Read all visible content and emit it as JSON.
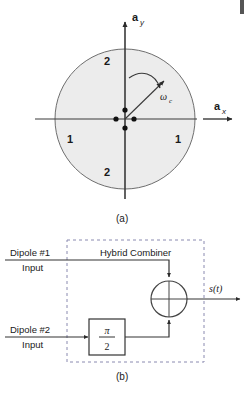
{
  "figure": {
    "panel_a": {
      "caption": "(a)",
      "axis_y_label": "a",
      "axis_y_sub": "y",
      "axis_x_label": "a",
      "axis_x_sub": "x",
      "rotation_label": "ω",
      "rotation_sub": "c",
      "region_labels": {
        "left": "1",
        "right": "1",
        "top": "2",
        "bottom": "2"
      },
      "circle_fill": "#ececec",
      "circle_stroke": "#666666",
      "dot_color": "#111111",
      "dot_count": 4
    },
    "panel_b": {
      "caption": "(b)",
      "box_title": "Hybrid Combiner",
      "input_1_line_1": "Dipole #1",
      "input_1_line_2": "Input",
      "input_2_line_1": "Dipole #2",
      "input_2_line_2": "Input",
      "phase_block_numerator": "π",
      "phase_block_denominator": "2",
      "output_label": "s(t)",
      "dashed_stroke": "#8a8ab0",
      "line_stroke": "#333333"
    }
  }
}
